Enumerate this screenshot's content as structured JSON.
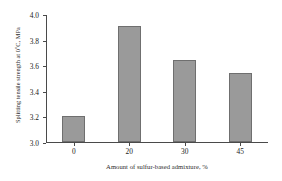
{
  "chart_data": {
    "type": "bar",
    "title": "",
    "subtitle": "",
    "categories": [
      "0",
      "20",
      "30",
      "45"
    ],
    "values": [
      3.2,
      3.9,
      3.64,
      3.54
    ],
    "xlabel": "Amount of sulfur-based admixture, %",
    "ylabel": "Splitting tensile strength at 0°C, MPa",
    "ylabel_parts": {
      "before": "Splitting tensile strength at 0",
      "degree": "o",
      "after": "C, MPa"
    },
    "ylim": [
      3.0,
      4.0
    ],
    "yticks": [
      "3.0",
      "3.2",
      "3.4",
      "3.6",
      "3.8",
      "4.0"
    ],
    "ytick_values": [
      3.0,
      3.2,
      3.4,
      3.6,
      3.8,
      4.0
    ],
    "grid": false,
    "legend": null,
    "legend_position": "none",
    "annotations": [],
    "colors": {
      "bar_fill": "#9a9a9a",
      "bar_border": "#6f6f6f",
      "axis": "#4a4a4a",
      "text": "#1a1a1a",
      "background": "#ffffff"
    }
  }
}
